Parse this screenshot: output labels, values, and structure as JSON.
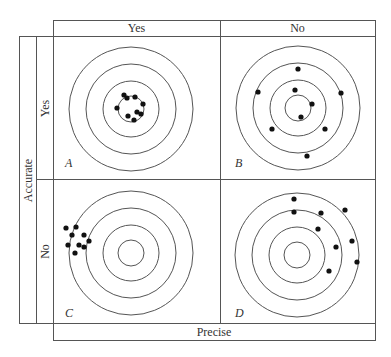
{
  "diagram": {
    "column_axis_label": "Precise",
    "row_axis_label": "Accurate",
    "column_headers": [
      "Yes",
      "No"
    ],
    "row_headers": [
      "Yes",
      "No"
    ],
    "colors": {
      "line": "#555555",
      "dot": "#111111",
      "background": "#ffffff"
    },
    "ring_radii": [
      62,
      45,
      28,
      13
    ],
    "quadrants": [
      {
        "letter": "A",
        "accurate": "Yes",
        "precise": "Yes",
        "center": [
          131,
          109
        ],
        "dots": [
          [
            124,
            95
          ],
          [
            127,
            98
          ],
          [
            135,
            97
          ],
          [
            143,
            104
          ],
          [
            117,
            108
          ],
          [
            137,
            112
          ],
          [
            128,
            116
          ],
          [
            141,
            114
          ],
          [
            134,
            120
          ]
        ]
      },
      {
        "letter": "B",
        "accurate": "Yes",
        "precise": "No",
        "center": [
          298,
          108
        ],
        "dots": [
          [
            298,
            69
          ],
          [
            258,
            92
          ],
          [
            295,
            90
          ],
          [
            341,
            93
          ],
          [
            312,
            104
          ],
          [
            301,
            117
          ],
          [
            272,
            129
          ],
          [
            325,
            129
          ],
          [
            307,
            156
          ]
        ]
      },
      {
        "letter": "C",
        "accurate": "No",
        "precise": "Yes",
        "center": [
          131,
          253
        ],
        "dots": [
          [
            66,
            228
          ],
          [
            76,
            227
          ],
          [
            72,
            235
          ],
          [
            84,
            235
          ],
          [
            68,
            245
          ],
          [
            79,
            245
          ],
          [
            84,
            247
          ],
          [
            89,
            241
          ],
          [
            75,
            253
          ]
        ]
      },
      {
        "letter": "D",
        "accurate": "No",
        "precise": "No",
        "center": [
          297,
          255
        ],
        "dots": [
          [
            294,
            199
          ],
          [
            294,
            212
          ],
          [
            321,
            213
          ],
          [
            345,
            210
          ],
          [
            318,
            229
          ],
          [
            336,
            247
          ],
          [
            352,
            241
          ],
          [
            357,
            262
          ],
          [
            329,
            271
          ]
        ]
      }
    ]
  }
}
